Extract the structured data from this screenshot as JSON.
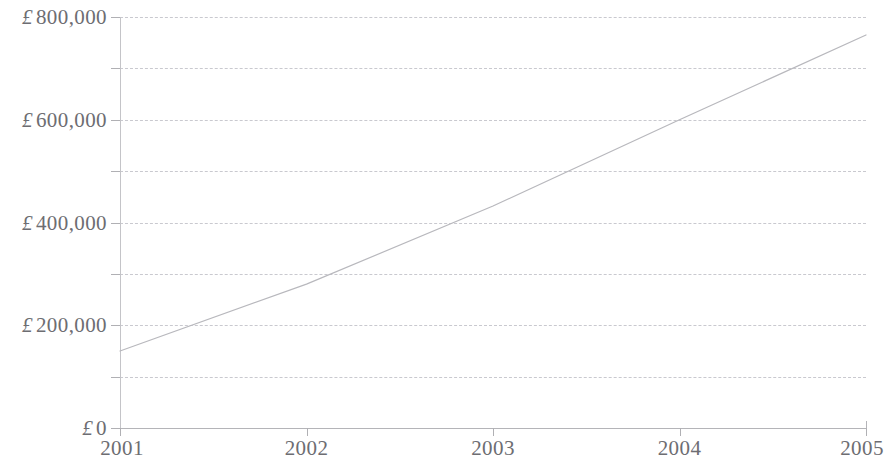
{
  "chart_data": {
    "type": "line",
    "title": "",
    "subtitle": "",
    "xlabel": "",
    "ylabel": "",
    "currency_symbol": "£",
    "x": [
      2001,
      2002,
      2003,
      2004,
      2005
    ],
    "categories": [
      "2001",
      "2002",
      "2003",
      "2004",
      "2005"
    ],
    "series": [
      {
        "name": "",
        "values": [
          150000,
          280000,
          432000,
          600000,
          765000
        ],
        "color": "#b8b8bd"
      }
    ],
    "xlim": [
      2001,
      2005
    ],
    "ylim": [
      0,
      800000
    ],
    "x_tick_labels": [
      "2001",
      "2002",
      "2003",
      "2004",
      "2005"
    ],
    "y_tick_labels": [
      "£ 800,000",
      "",
      "£ 600,000",
      "",
      "£ 400,000",
      "",
      "£ 200,000",
      "",
      "£ 0"
    ],
    "y_tick_values": [
      800000,
      700000,
      600000,
      500000,
      400000,
      300000,
      200000,
      100000,
      0
    ],
    "y_labeled_ticks": [
      {
        "value": 800000,
        "prefix": "£",
        "text": "800,000"
      },
      {
        "value": 600000,
        "prefix": "£",
        "text": "600,000"
      },
      {
        "value": 400000,
        "prefix": "£",
        "text": "400,000"
      },
      {
        "value": 200000,
        "prefix": "£",
        "text": "200,000"
      },
      {
        "value": 0,
        "prefix": "£",
        "text": "0"
      }
    ],
    "grid": {
      "horizontal": true,
      "vertical": false,
      "style": "dashed",
      "color": "#c9c9cf",
      "interval": 100000
    },
    "legend": {
      "visible": false,
      "position": "none"
    },
    "axis_color": "#b4b4b8",
    "text_color": "#6d6d72"
  }
}
